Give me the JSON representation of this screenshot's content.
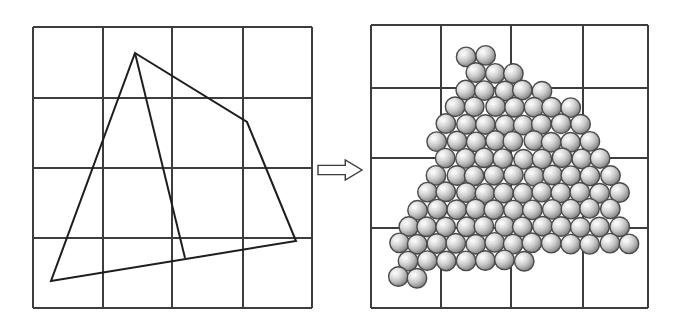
{
  "figure": {
    "caption": "",
    "background": "#ffffff",
    "arrow": {
      "name": "transformation-arrow",
      "direction": "right",
      "label": "",
      "stroke": "#3a3a3a",
      "fill": "#ffffff",
      "x": 318,
      "y": 160,
      "width": 44,
      "height": 20
    },
    "panels": [
      {
        "id": "left-panel",
        "role": "source-geometry",
        "label": "",
        "frame": {
          "x": 33,
          "y": 27,
          "width": 279,
          "height": 281
        },
        "grid": {
          "columns": 4,
          "rows": 4,
          "stroke": "#3d3d3d",
          "stroke_width": 1.1,
          "border_width": 1.6,
          "x_lines": [
            33,
            103,
            172,
            243,
            312
          ],
          "y_lines": [
            27,
            98,
            168,
            238,
            308
          ]
        },
        "shapes": [
          {
            "name": "outer-polygon",
            "type": "polygon",
            "closed": true,
            "stroke": "#1d1d1d",
            "stroke_width": 2.0,
            "fill": "none",
            "points": [
              [
                135,
                53
              ],
              [
                247,
                122
              ],
              [
                296,
                241
              ],
              [
                51,
                281
              ]
            ]
          },
          {
            "name": "interior-edge",
            "type": "polyline",
            "closed": false,
            "stroke": "#1d1d1d",
            "stroke_width": 2.0,
            "fill": "none",
            "points": [
              [
                135,
                53
              ],
              [
                185,
                258
              ]
            ]
          }
        ]
      },
      {
        "id": "right-panel",
        "role": "sphere-packing",
        "label": "",
        "frame": {
          "x": 371,
          "y": 25,
          "width": 277,
          "height": 283
        },
        "grid": {
          "columns": 4,
          "rows": 4,
          "stroke": "#3d3d3d",
          "stroke_width": 1.1,
          "border_width": 1.6,
          "x_lines": [
            371,
            441,
            511,
            583,
            648
          ],
          "y_lines": [
            25,
            88,
            158,
            228,
            308
          ]
        },
        "packing": {
          "name": "sphere-packing",
          "sphere_diameter": 19.5,
          "sphere_count": 118,
          "lattice": "hexagonal",
          "row_spacing": 17.0,
          "colors": {
            "outline": "#4a4a4a",
            "outline_width": 1.4,
            "highlight": "#efefef",
            "mid": "#c9c9c9",
            "shadow": "#8f8f8f",
            "deep_shadow": "#6e6e6e"
          },
          "region_polygon": [
            [
              473,
              51
            ],
            [
              585,
              120
            ],
            [
              634,
              239
            ],
            [
              389,
              279
            ]
          ],
          "region_interior_edge": [
            [
              473,
              51
            ],
            [
              523,
              256
            ]
          ]
        }
      }
    ]
  }
}
